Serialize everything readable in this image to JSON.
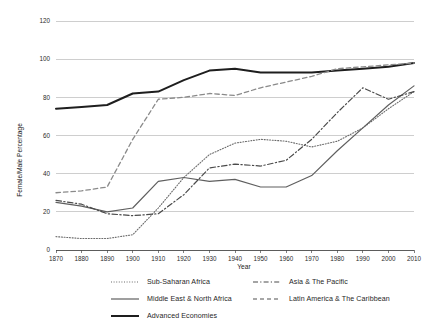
{
  "chart_data": {
    "type": "line",
    "title": "",
    "xlabel": "Year",
    "ylabel": "Female/Male Percentage",
    "xlim": [
      1870,
      2010
    ],
    "ylim": [
      0,
      120
    ],
    "xticks": [
      1870,
      1880,
      1890,
      1900,
      1910,
      1920,
      1930,
      1940,
      1950,
      1960,
      1970,
      1980,
      1990,
      2000,
      2010
    ],
    "yticks": [
      0,
      20,
      40,
      60,
      80,
      100,
      120
    ],
    "grid": true,
    "legend_position": "below",
    "x": [
      1870,
      1880,
      1890,
      1900,
      1910,
      1920,
      1930,
      1940,
      1950,
      1960,
      1970,
      1980,
      1990,
      2000,
      2010
    ],
    "series": [
      {
        "name": "Sub-Saharan Africa",
        "style": "dotted",
        "color": "#6b6b6b",
        "width": 1.1,
        "values": [
          7,
          6,
          6,
          8,
          22,
          38,
          50,
          56,
          58,
          57,
          54,
          57,
          64,
          74,
          83
        ]
      },
      {
        "name": "Middle East & North Africa",
        "style": "solid",
        "color": "#5f5f5f",
        "width": 1.2,
        "values": [
          25,
          23,
          20,
          22,
          36,
          38,
          36,
          37,
          33,
          33,
          39,
          52,
          64,
          76,
          86
        ]
      },
      {
        "name": "Advanced Economies",
        "style": "solid",
        "color": "#1e1e1e",
        "width": 2.0,
        "values": [
          74,
          75,
          76,
          82,
          83,
          89,
          94,
          95,
          93,
          93,
          93,
          94,
          95,
          96,
          98
        ]
      },
      {
        "name": "Asia & The Pacific",
        "style": "dashdot",
        "color": "#4a4a4a",
        "width": 1.2,
        "values": [
          26,
          24,
          19,
          18,
          19,
          29,
          43,
          45,
          44,
          47,
          58,
          72,
          85,
          79,
          83
        ]
      },
      {
        "name": "Latin America & The Caribbean",
        "style": "dashed",
        "color": "#8a8a8a",
        "width": 1.3,
        "values": [
          30,
          31,
          33,
          58,
          79,
          80,
          82,
          81,
          85,
          88,
          91,
          95,
          96,
          97,
          98
        ]
      }
    ]
  },
  "axes": {
    "y_title": "Female/Male Percentage",
    "x_title": "Year",
    "y_ticks": [
      "0",
      "20",
      "40",
      "60",
      "80",
      "100",
      "120"
    ],
    "x_ticks": [
      "1870",
      "1880",
      "1890",
      "1900",
      "1910",
      "1920",
      "1930",
      "1940",
      "1950",
      "1960",
      "1970",
      "1980",
      "1990",
      "2000",
      "2010"
    ]
  },
  "legend": {
    "items": [
      {
        "label": "Sub-Saharan Africa",
        "style": "dotted"
      },
      {
        "label": "Middle East & North Africa",
        "style": "solid-thin"
      },
      {
        "label": "Advanced Economies",
        "style": "solid-thick"
      },
      {
        "label": "Asia & The Pacific",
        "style": "dashdot"
      },
      {
        "label": "Latin America & The Caribbean",
        "style": "dashed"
      }
    ]
  }
}
